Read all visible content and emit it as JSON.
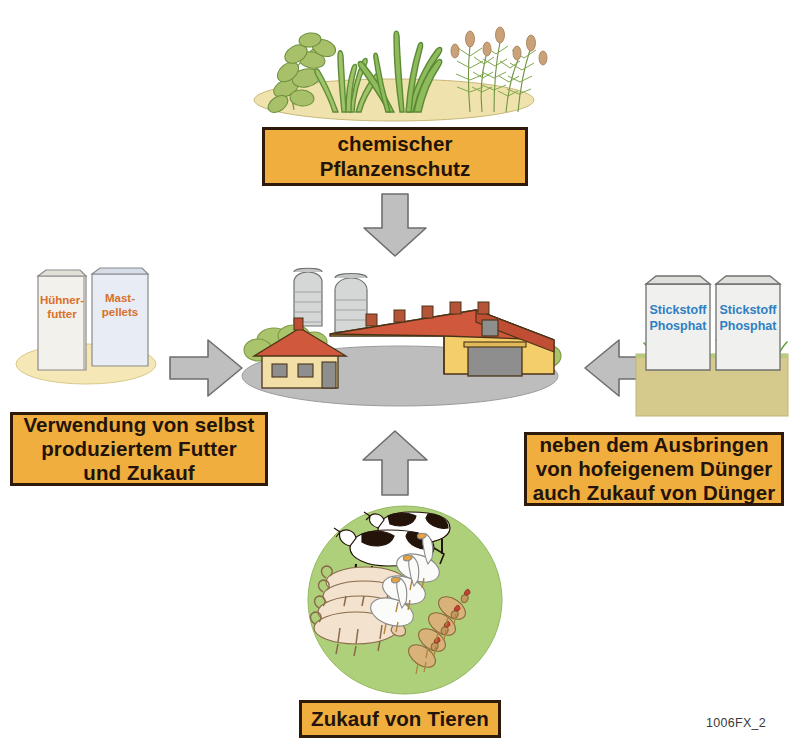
{
  "figure": {
    "code": "1006FX_2",
    "language": "de"
  },
  "callouts": [
    {
      "id": "pesticide",
      "text": "chemischer\nPflanzenschutz",
      "position": "top"
    },
    {
      "id": "feed",
      "text": "Verwendung von selbst\nproduziertem Futter\nund Zukauf",
      "position": "left"
    },
    {
      "id": "fertilizer",
      "text": "neben dem Ausbringen\nvon hofeigenem Dünger\nauch Zukauf von Dünger",
      "position": "right"
    },
    {
      "id": "animals",
      "text": "Zukauf von Tieren",
      "position": "bottom"
    }
  ],
  "illustrations": {
    "plants": {
      "name": "crop-plants-on-sand-ellipse",
      "ground_color": "#EFE2AC"
    },
    "feed_bags": {
      "name": "animal-feed-sacks",
      "ground_color": "#F5E8B6",
      "bags": [
        {
          "label": "Hühner-\nfutter",
          "text_color": "#D9702B"
        },
        {
          "label": "Mast-\npellets",
          "text_color": "#D9702B"
        }
      ]
    },
    "farm": {
      "name": "farmstead-with-silos",
      "ground_color": "#BDBDBD",
      "roof_color": "#D0583C",
      "wall_color": "#F4CE6A",
      "silo_color": "#D5D7D6"
    },
    "fertilizer_bags": {
      "name": "mineral-fertilizer-sacks",
      "ground_color": "#D6C98C",
      "bags": [
        {
          "label": "Stickstoff\nPhosphat",
          "text_color": "#2E7FC2"
        },
        {
          "label": "Stickstoff\nPhosphat",
          "text_color": "#2E7FC2"
        }
      ]
    },
    "livestock": {
      "name": "farm-animals-on-pasture-ellipse",
      "ground_color": "#AFD07A",
      "animals": [
        "cattle",
        "pigs",
        "geese",
        "chickens"
      ]
    }
  },
  "arrows": [
    {
      "id": "pesticide-to-farm",
      "direction": "down",
      "color": "#BFBFBF"
    },
    {
      "id": "feed-to-farm",
      "direction": "right",
      "color": "#BFBFBF"
    },
    {
      "id": "fertilizer-to-farm",
      "direction": "left",
      "color": "#BFBFBF"
    },
    {
      "id": "animals-to-farm",
      "direction": "up",
      "color": "#BFBFBF"
    }
  ],
  "colors": {
    "callout_fill": "#EFAE3E",
    "callout_border": "#2E1A0B",
    "arrow_fill": "#BFBFBF",
    "arrow_stroke": "#6E6E6E",
    "page_background": "#FFFFFF"
  }
}
